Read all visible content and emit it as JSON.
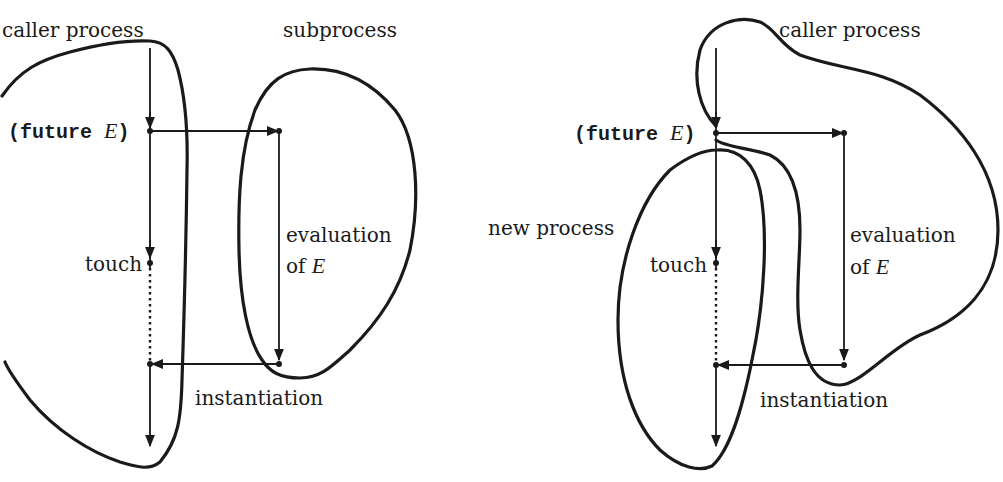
{
  "left_diagram": {
    "caller_label": "caller process",
    "subprocess_label": "subprocess",
    "future_open": "(future ",
    "future_var": "E",
    "future_close": ")",
    "touch_label": "touch",
    "evaluation_line1": "evaluation",
    "evaluation_line2_prefix": "of ",
    "evaluation_var": "E",
    "instantiation_label": "instantiation"
  },
  "right_diagram": {
    "caller_label": "caller process",
    "new_process_label": "new process",
    "future_open": "(future ",
    "future_var": "E",
    "future_close": ")",
    "touch_label": "touch",
    "evaluation_line1": "evaluation",
    "evaluation_line2_prefix": "of ",
    "evaluation_var": "E",
    "instantiation_label": "instantiation"
  },
  "colors": {
    "ink": "#1a1a1a",
    "background": "#ffffff"
  }
}
